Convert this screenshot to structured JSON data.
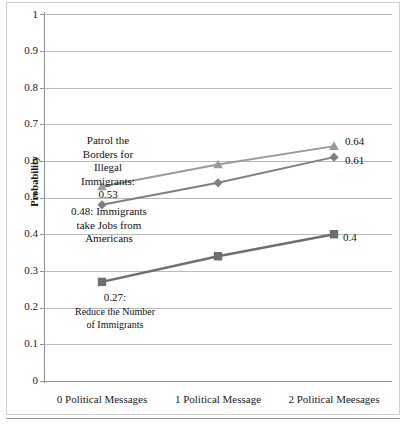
{
  "chart_data": {
    "type": "line",
    "title": "",
    "xlabel": "",
    "ylabel": "Probability",
    "categories": [
      "0 Political Messages",
      "1 Political Message",
      "2 Political Meesages"
    ],
    "ylim": [
      0,
      1
    ],
    "yticks": [
      "0",
      "0.1",
      "0.2",
      "0.3",
      "0.4",
      "0.5",
      "0.6",
      "0.7",
      "0.8",
      "0.9",
      "1"
    ],
    "grid": true,
    "legend": "none",
    "series": [
      {
        "name": "Patrol the Borders for Illegal Immigrants",
        "values": [
          0.53,
          0.59,
          0.64
        ],
        "marker": "triangle",
        "color": "#9a9a9a"
      },
      {
        "name": "Immigrants take Jobs from Americans",
        "values": [
          0.48,
          0.54,
          0.61
        ],
        "marker": "diamond",
        "color": "#808080"
      },
      {
        "name": "Reduce the Number of Immigrants",
        "values": [
          0.27,
          0.34,
          0.4
        ],
        "marker": "square",
        "color": "#6e6e6e"
      }
    ],
    "annotations": [
      {
        "id": "patrol-borders",
        "text": "Patrol the Borders for Illegal Immigrants: 0.53",
        "lines": [
          "Patrol the",
          "Borders for",
          "Illegal",
          "Immigrants:",
          "0.53"
        ]
      },
      {
        "id": "immigrants-jobs",
        "text": "0.48: Immigrants take Jobs from Americans",
        "lines": [
          "0.48: Immigrants",
          "take Jobs from",
          "Americans"
        ]
      },
      {
        "id": "reduce-number",
        "text": "0.27: Reduce the Number of Immigrants",
        "lines": [
          "0.27:",
          "Reduce the Number",
          "of Immigrants"
        ]
      }
    ],
    "point_labels": [
      {
        "id": "patrol-end",
        "value": "0.64"
      },
      {
        "id": "jobs-end",
        "value": "0.61"
      },
      {
        "id": "reduce-end",
        "value": "0.4"
      }
    ]
  },
  "axis": {
    "y_title": "Probability",
    "y_ticks": [
      "1",
      "0.9",
      "0.8",
      "0.7",
      "0.6",
      "0.5",
      "0.4",
      "0.3",
      "0.2",
      "0.1",
      "0"
    ],
    "x_ticks": [
      "0 Political Messages",
      "1 Political Message",
      "2 Political Meesages"
    ]
  },
  "annotation_text": {
    "patrol_l1": "Patrol the",
    "patrol_l2": "Borders for",
    "patrol_l3": "Illegal",
    "patrol_l4": "Immigrants:",
    "patrol_l5": "0.53",
    "jobs_l1": "0.48: Immigrants",
    "jobs_l2": "take Jobs from",
    "jobs_l3": "Americans",
    "reduce_l1": "0.27:",
    "reduce_l2": "Reduce the Number",
    "reduce_l3": "of Immigrants"
  },
  "end_labels": {
    "patrol": "0.64",
    "jobs": "0.61",
    "reduce": "0.4"
  },
  "colors": {
    "series_patrol": "#9a9a9a",
    "series_jobs": "#808080",
    "series_reduce": "#6e6e6e",
    "gridline": "#b9b9b9",
    "axis": "#8f8f8f",
    "frame": "#cfcfcf"
  }
}
